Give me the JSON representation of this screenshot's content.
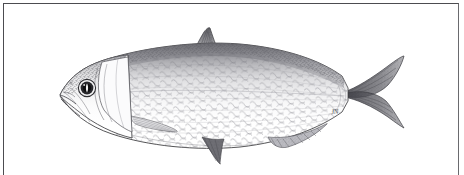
{
  "plate": {
    "kind": "scientific-illustration",
    "medium": "pen-and-ink stipple drawing",
    "subject": "herring-like fish, lateral view, facing left",
    "background_color": "#ffffff",
    "ink_color": "#3a3a3c",
    "frame": {
      "border_color": "#4c4c50",
      "border_width_px": 1,
      "inset_px": 3,
      "bottom_edge": "open"
    },
    "signature": "JN"
  },
  "anatomy": {
    "body": {
      "label": "body",
      "fill": "#ffffff",
      "outline_color": "#3f3f42",
      "dorsal_shading": "#6e6e73",
      "ventral_shading": "#f4f4f5",
      "extent_px": {
        "x1": 60,
        "y1": 28,
        "x2": 404,
        "y2": 158
      }
    },
    "head": {
      "label": "head",
      "snout_tip_px": {
        "x": 60,
        "y": 95
      },
      "operculum_color": "#fbfbfc",
      "operculum_edge": "#55555a"
    },
    "eye": {
      "label": "eye",
      "center_px": {
        "x": 87,
        "y": 88
      },
      "radius_px": 8,
      "iris_color": "#2a2a2d",
      "pupil_color": "#101012",
      "highlight_color": "#ffffff"
    },
    "mouth": {
      "label": "mouth",
      "orientation": "superior, slightly upturned"
    },
    "scales": {
      "label": "scale-pattern",
      "type": "cycloid diamond lattice",
      "line_color": "#8d8d93",
      "cell_width_px": 11,
      "cell_height_px": 9
    }
  },
  "fins": [
    {
      "name": "dorsal-fin",
      "shape": "triangular, falcate",
      "position_px": {
        "x": 205,
        "y": 55
      },
      "shading": "#6b6b70"
    },
    {
      "name": "pectoral-fin",
      "shape": "low, rayed",
      "position_px": {
        "x": 150,
        "y": 118
      },
      "shading": "#86868c"
    },
    {
      "name": "pelvic-fin",
      "shape": "small triangular",
      "position_px": {
        "x": 212,
        "y": 140
      },
      "shading": "#5f5f65"
    },
    {
      "name": "anal-fin",
      "shape": "long and low",
      "position_px": {
        "x": 295,
        "y": 128
      },
      "shading": "#7a7a80"
    },
    {
      "name": "caudal-fin",
      "shape": "deeply forked",
      "position_px": {
        "x": 375,
        "y": 92
      },
      "shading": "#55555b"
    }
  ],
  "caption": {
    "text": ""
  }
}
